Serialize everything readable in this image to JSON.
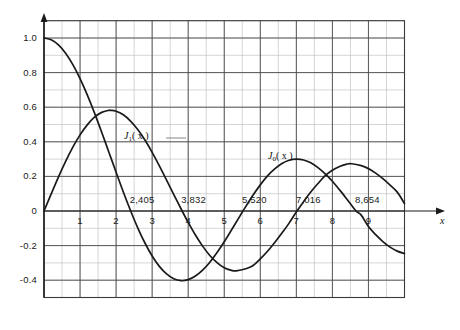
{
  "chart_data": {
    "type": "line",
    "title": "",
    "subtitle": "",
    "xlabel": "x",
    "ylabel": "",
    "xlim": [
      -0.15,
      10.0
    ],
    "ylim": [
      -0.5,
      1.1
    ],
    "grid": true,
    "grid_major_x": 1,
    "grid_minor_x": 0.5,
    "grid_major_y": 0.2,
    "grid_minor_y": 0.1,
    "legend_position": "inline-annotations",
    "xticks": [
      1,
      2,
      3,
      4,
      5,
      6,
      7,
      8,
      9
    ],
    "xtick_labels": [
      "1",
      "2",
      "3",
      "4",
      "5",
      "6",
      "7",
      "8",
      "9"
    ],
    "yticks": [
      1.0,
      0.8,
      0.6,
      0.4,
      0.2,
      0,
      -0.2,
      -0.4
    ],
    "ytick_labels": [
      "1.0",
      "0.8",
      "0.6",
      "0.4",
      "0.2",
      "0",
      "-0.2",
      "-0.4"
    ],
    "annotations": [
      {
        "name": "j0-zero-1",
        "label": "2,405",
        "x": 2.405,
        "y": 0
      },
      {
        "name": "j1-zero-1",
        "label": "3,832",
        "x": 3.832,
        "y": 0
      },
      {
        "name": "j0-zero-2",
        "label": "5,520",
        "x": 5.52,
        "y": 0
      },
      {
        "name": "j1-zero-2",
        "label": "7,016",
        "x": 7.016,
        "y": 0
      },
      {
        "name": "j0-zero-3",
        "label": "8,654",
        "x": 8.654,
        "y": 0
      }
    ],
    "series": [
      {
        "name": "J0(x)",
        "label_main": "J",
        "label_sub": "0",
        "label_arg": "( x )",
        "color": "#1a1a1a",
        "x": [
          0,
          0.2,
          0.4,
          0.6,
          0.8,
          1.0,
          1.2,
          1.4,
          1.6,
          1.8,
          2.0,
          2.2,
          2.405,
          2.6,
          2.8,
          3.0,
          3.2,
          3.4,
          3.6,
          3.8,
          4.0,
          4.2,
          4.4,
          4.6,
          4.8,
          5.0,
          5.2,
          5.4,
          5.52,
          5.8,
          6.0,
          6.2,
          6.4,
          6.6,
          6.8,
          7.0,
          7.2,
          7.4,
          7.6,
          7.8,
          8.0,
          8.2,
          8.4,
          8.654,
          8.8,
          9.0,
          9.2,
          9.4,
          9.6,
          9.8,
          10.0
        ],
        "y": [
          1.0,
          0.99,
          0.96,
          0.912,
          0.846,
          0.765,
          0.671,
          0.567,
          0.455,
          0.34,
          0.224,
          0.11,
          0.0,
          -0.097,
          -0.185,
          -0.26,
          -0.32,
          -0.364,
          -0.392,
          -0.403,
          -0.397,
          -0.376,
          -0.342,
          -0.296,
          -0.24,
          -0.178,
          -0.11,
          -0.041,
          0.0,
          0.092,
          0.151,
          0.203,
          0.243,
          0.274,
          0.293,
          0.3,
          0.295,
          0.279,
          0.251,
          0.215,
          0.172,
          0.122,
          0.069,
          0.0,
          -0.024,
          -0.09,
          -0.137,
          -0.177,
          -0.209,
          -0.232,
          -0.246
        ]
      },
      {
        "name": "J1(x)",
        "label_main": "J",
        "label_sub": "1",
        "label_arg": "( x )",
        "color": "#1a1a1a",
        "x": [
          0,
          0.2,
          0.4,
          0.6,
          0.8,
          1.0,
          1.2,
          1.4,
          1.6,
          1.8,
          1.841,
          2.0,
          2.2,
          2.4,
          2.6,
          2.8,
          3.0,
          3.2,
          3.4,
          3.6,
          3.832,
          4.0,
          4.2,
          4.4,
          4.6,
          4.8,
          5.0,
          5.2,
          5.331,
          5.6,
          5.8,
          6.0,
          6.2,
          6.4,
          6.6,
          6.8,
          7.0,
          7.016,
          7.2,
          7.4,
          7.6,
          7.8,
          8.0,
          8.2,
          8.4,
          8.536,
          8.8,
          9.0,
          9.2,
          9.4,
          9.6,
          9.8,
          10.0
        ],
        "y": [
          0.0,
          0.099,
          0.196,
          0.287,
          0.369,
          0.44,
          0.498,
          0.542,
          0.57,
          0.582,
          0.5819,
          0.577,
          0.556,
          0.52,
          0.471,
          0.41,
          0.339,
          0.261,
          0.179,
          0.095,
          0.0,
          -0.066,
          -0.139,
          -0.203,
          -0.257,
          -0.298,
          -0.328,
          -0.343,
          -0.3461,
          -0.334,
          -0.315,
          -0.277,
          -0.233,
          -0.182,
          -0.127,
          -0.07,
          -0.005,
          0.0,
          0.054,
          0.11,
          0.159,
          0.204,
          0.235,
          0.257,
          0.271,
          0.2731,
          0.262,
          0.245,
          0.219,
          0.187,
          0.15,
          0.109,
          0.043
        ]
      }
    ]
  },
  "axes": {
    "x_axis_name": "x",
    "y_axis_name": ""
  }
}
